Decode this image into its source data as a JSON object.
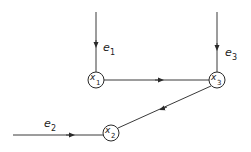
{
  "diagram": {
    "type": "signal-flow-graph",
    "colors": {
      "line": "#3a3a3a",
      "background": "#ffffff"
    },
    "nodes": [
      {
        "id": "x1",
        "label": "x",
        "sub": "1",
        "cx": 96,
        "cy": 80
      },
      {
        "id": "x3",
        "label": "x",
        "sub": "3",
        "cx": 217,
        "cy": 80
      },
      {
        "id": "x2",
        "label": "x",
        "sub": "2",
        "cx": 111,
        "cy": 131
      }
    ],
    "inputs": [
      {
        "id": "e1",
        "label": "e",
        "sub": "1",
        "target": "x1"
      },
      {
        "id": "e3",
        "label": "e",
        "sub": "3",
        "target": "x3"
      },
      {
        "id": "e2",
        "label": "e",
        "sub": "2",
        "target": "x2"
      }
    ],
    "edges": [
      {
        "from": "x1",
        "to": "x3"
      },
      {
        "from": "x3",
        "to": "x2"
      }
    ]
  }
}
